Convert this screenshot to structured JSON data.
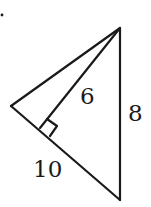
{
  "diagram": {
    "type": "geometry-triangle",
    "colors": {
      "stroke": "#1a1a1a",
      "background": "#ffffff"
    },
    "points": {
      "apex": {
        "x": 120,
        "y": 28
      },
      "left": {
        "x": 11,
        "y": 106
      },
      "foot": {
        "x": 40,
        "y": 128
      },
      "bottom": {
        "x": 120,
        "y": 200
      }
    },
    "labels": {
      "altitude": "6",
      "right_side": "8",
      "bottom_left_side": "10"
    },
    "right_angle_marker": true
  }
}
